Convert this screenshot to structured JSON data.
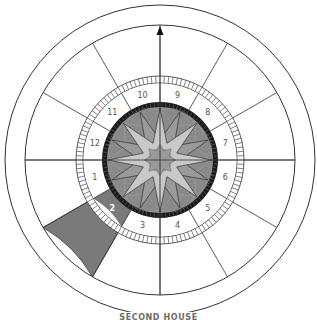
{
  "caption": "SECOND HOUSE",
  "chart": {
    "center": [
      160,
      160
    ],
    "highlighted_house": 2,
    "house_numbers": [
      "1",
      "2",
      "3",
      "4",
      "5",
      "6",
      "7",
      "8",
      "9",
      "10",
      "11",
      "12"
    ],
    "colors": {
      "line": "#333333",
      "highlight": "#7a7a7a",
      "disk": "#8a8a8a",
      "star_light": "#c8c8c8",
      "star_mid": "#9a9a9a",
      "tick_ring_dark": "#1a1a1a"
    },
    "indicator": "up-arrow"
  }
}
